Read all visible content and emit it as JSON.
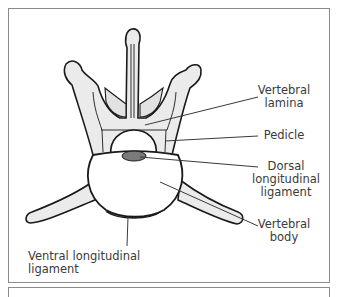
{
  "diagram": {
    "labels": {
      "vertebral_lamina_1": "Vertebral",
      "vertebral_lamina_2": "lamina",
      "pedicle": "Pedicle",
      "dorsal_1": "Dorsal",
      "dorsal_2": "longitudinal",
      "dorsal_3": "ligament",
      "body_1": "Vertebral",
      "body_2": "body",
      "ventral": "Ventral longitudinal ligament"
    },
    "colors": {
      "outline": "#1a1a1a",
      "bone_fill": "#ebebeb",
      "body_fill": "#ffffff",
      "ligament_fill": "#7a7a7a",
      "leader_line": "#3a3a3a",
      "frame": "#8a8a8a"
    }
  }
}
